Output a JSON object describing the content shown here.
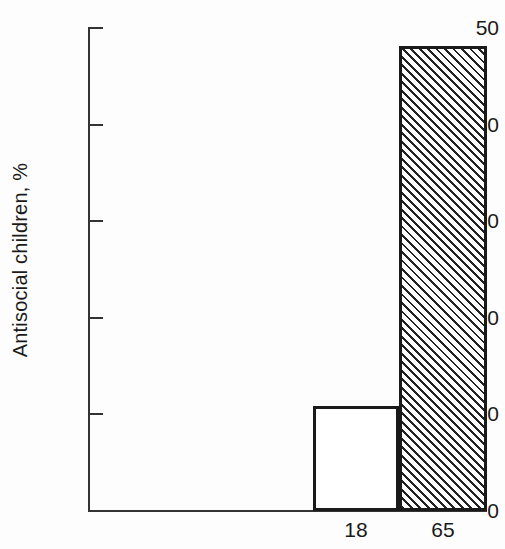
{
  "chart_data": {
    "type": "bar",
    "title": "",
    "xlabel": "",
    "ylabel": "Antisocial children, %",
    "categories": [
      "18",
      "65"
    ],
    "values": [
      10.8,
      48.0
    ],
    "ylim": [
      0,
      50
    ],
    "yticks": [
      0,
      10,
      20,
      30,
      40,
      50
    ],
    "ytick_labels": [
      "0",
      "10",
      "20",
      "30",
      "40",
      "50"
    ],
    "grid": false,
    "legend": null,
    "series": [
      {
        "name": "Antisocial children",
        "values": [
          10.8,
          48.0
        ],
        "styles": [
          "open",
          "hatched"
        ]
      }
    ],
    "bar_styles": {
      "open": {
        "fill": "#ffffff",
        "edge": "#1a1a1a"
      },
      "hatched": {
        "fill": "#ffffff",
        "hatch": "/",
        "edge": "#1a1a1a"
      }
    },
    "colors": {
      "axis": "#333333",
      "text": "#1a1a1a",
      "background": "#fdfdfd",
      "hatch": "#222222"
    }
  }
}
